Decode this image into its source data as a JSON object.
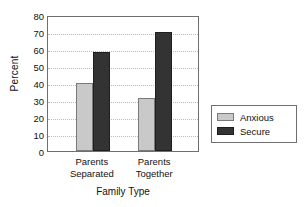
{
  "chart_data": {
    "type": "bar",
    "title": "",
    "xlabel": "Family Type",
    "ylabel": "Percent",
    "categories": [
      "Parents Separated",
      "Parents Together"
    ],
    "category_lines": [
      [
        "Parents",
        "Separated"
      ],
      [
        "Parents",
        "Together"
      ]
    ],
    "series": [
      {
        "name": "Anxious",
        "values": [
          40,
          31
        ],
        "color": "#c9c9c9"
      },
      {
        "name": "Secure",
        "values": [
          58.5,
          70
        ],
        "color": "#333333"
      }
    ],
    "ylim": [
      0,
      80
    ],
    "ytick_step": 10,
    "yticks": [
      80,
      70,
      60,
      50,
      40,
      30,
      20,
      10,
      0
    ],
    "grid": true,
    "grid_style": "dotted-horizontal",
    "legend_position": "right",
    "legend": [
      {
        "label": "Anxious",
        "swatch": "light-gray"
      },
      {
        "label": "Secure",
        "swatch": "dark-gray"
      }
    ]
  }
}
